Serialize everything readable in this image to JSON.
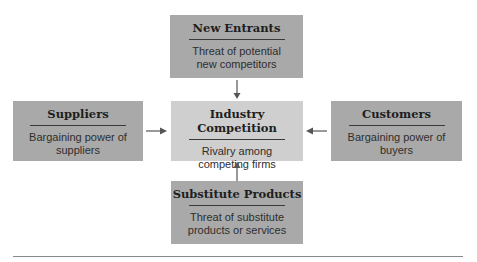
{
  "diagram": {
    "type": "five-forces",
    "center": {
      "title": "Industry Competition",
      "desc_line1": "Rivalry among",
      "desc_line2": "competing firms"
    },
    "top": {
      "title": "New Entrants",
      "desc_line1": "Threat of potential",
      "desc_line2": "new competitors"
    },
    "left": {
      "title": "Suppliers",
      "desc_line1": "Bargaining power of",
      "desc_line2": "suppliers"
    },
    "right": {
      "title": "Customers",
      "desc_line1": "Bargaining power of",
      "desc_line2": "buyers"
    },
    "bottom": {
      "title": "Substitute Products",
      "desc_line1": "Threat of substitute",
      "desc_line2": "products or services"
    },
    "edges": [
      {
        "from": "top",
        "to": "center"
      },
      {
        "from": "left",
        "to": "center"
      },
      {
        "from": "right",
        "to": "center"
      },
      {
        "from": "bottom",
        "to": "center"
      }
    ],
    "colors": {
      "outer_box": "#a9a9a9",
      "center_box": "#cfcfcf",
      "arrow": "#555555"
    }
  }
}
